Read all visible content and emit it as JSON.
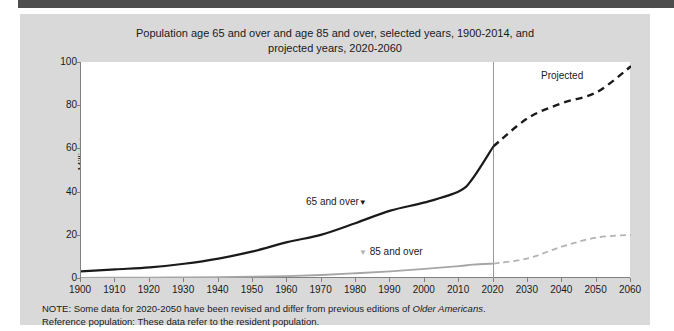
{
  "figure": {
    "title_line1": "Population age 65 and over and age 85 and over, selected years, 1900-2014, and",
    "title_line2": "projected years, 2020-2060",
    "panel_color": "#d9d9d9",
    "plot_color": "#ffffff",
    "topbar_color": "#4d4d4d"
  },
  "labels": {
    "series_65": "65 and over",
    "series_65_marker": "▼",
    "series_85": "85 and over",
    "series_85_marker": "▼",
    "projected": "Projected",
    "ylabel": "Millions"
  },
  "notes": {
    "line1_pre": "NOTE: Some data for 2020-2050 have been revised and differ from previous editions of ",
    "line1_italic": "Older Americans",
    "line1_post": ".",
    "line2": "Reference population: These data refer to the resident population."
  },
  "chart_data": {
    "type": "line",
    "title": "Population age 65 and over and age 85 and over, selected years, 1900-2014, and projected years, 2020-2060",
    "xlabel": "",
    "ylabel": "Millions",
    "xlim": [
      1900,
      2060
    ],
    "ylim": [
      0,
      100
    ],
    "yticks": [
      0,
      20,
      40,
      60,
      80,
      100
    ],
    "xticks": [
      1900,
      1910,
      1920,
      1930,
      1940,
      1950,
      1960,
      1970,
      1980,
      1990,
      2000,
      2010,
      2020,
      2030,
      2040,
      2050,
      2060
    ],
    "grid": false,
    "legend_position": "inline-annotation",
    "projection_start_year": 2020,
    "annotations": [
      "Projected"
    ],
    "series": [
      {
        "name": "65 and over",
        "color": "#1a1a1a",
        "historical": {
          "x": [
            1900,
            1910,
            1920,
            1930,
            1940,
            1950,
            1960,
            1970,
            1980,
            1990,
            2000,
            2010,
            2014,
            2020
          ],
          "y": [
            3.1,
            4.0,
            4.9,
            6.6,
            9.0,
            12.3,
            16.6,
            20.1,
            25.5,
            31.2,
            35.0,
            40.2,
            46.2,
            61.0
          ]
        },
        "projected": {
          "x": [
            2020,
            2030,
            2040,
            2050,
            2060
          ],
          "y": [
            61.0,
            74.0,
            81.0,
            86.0,
            98.0
          ]
        }
      },
      {
        "name": "85 and over",
        "color": "#a6a6a6",
        "historical": {
          "x": [
            1900,
            1910,
            1920,
            1930,
            1940,
            1950,
            1960,
            1970,
            1980,
            1990,
            2000,
            2010,
            2014,
            2020
          ],
          "y": [
            0.1,
            0.2,
            0.2,
            0.3,
            0.4,
            0.6,
            0.9,
            1.4,
            2.2,
            3.1,
            4.2,
            5.5,
            6.2,
            6.7
          ]
        },
        "projected": {
          "x": [
            2020,
            2030,
            2040,
            2050,
            2060
          ],
          "y": [
            6.7,
            9.1,
            14.6,
            18.7,
            20.0
          ]
        }
      }
    ]
  }
}
